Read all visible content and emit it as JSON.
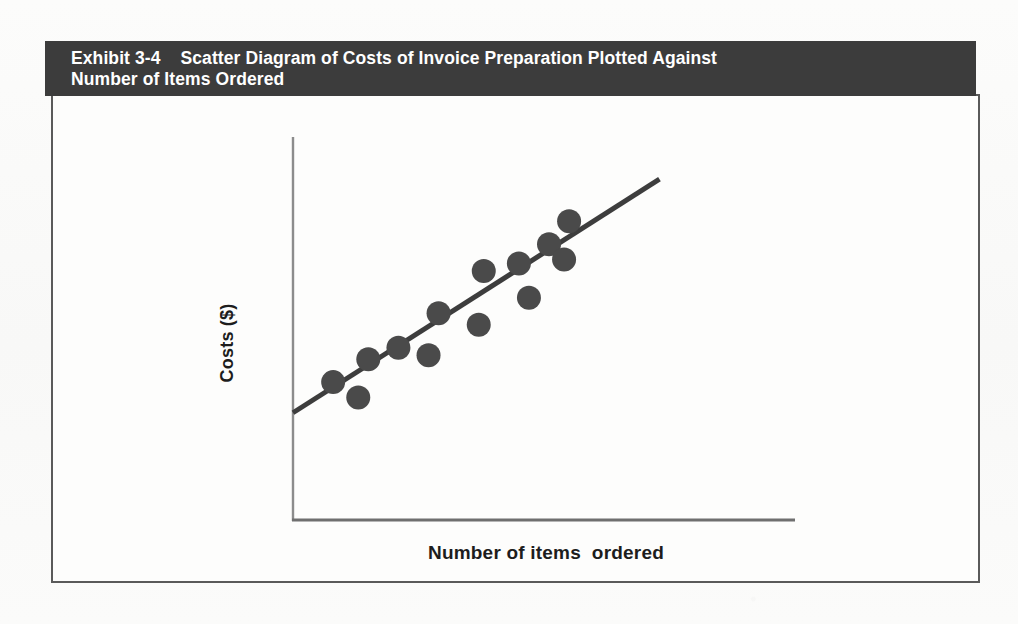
{
  "page": {
    "background_color": "#fbfbfa"
  },
  "exhibit": {
    "header_background": "#3c3c3c",
    "header_text_color": "#ffffff",
    "title_line1": "Exhibit 3-4    Scatter Diagram of Costs of Invoice Preparation Plotted Against",
    "title_line2": "Number of Items Ordered",
    "border_color": "#5a5a5a",
    "body_background": "#fdfdfc"
  },
  "chart_data": {
    "type": "scatter",
    "title": "Exhibit 3-4    Scatter Diagram of Costs of Invoice Preparation Plotted Against Number of Items Ordered",
    "xlabel": "Number of items  ordered",
    "ylabel": "Costs ($)",
    "xlim": [
      0,
      100
    ],
    "ylim": [
      0,
      100
    ],
    "grid": false,
    "legend": null,
    "axis_ticks": {
      "x": [],
      "y": []
    },
    "marker": {
      "shape": "circle",
      "color": "#4a4a4a",
      "radius_px": 12
    },
    "points": [
      {
        "x": 8,
        "y": 36
      },
      {
        "x": 13,
        "y": 32
      },
      {
        "x": 15,
        "y": 42
      },
      {
        "x": 21,
        "y": 45
      },
      {
        "x": 27,
        "y": 43
      },
      {
        "x": 29,
        "y": 54
      },
      {
        "x": 37,
        "y": 51
      },
      {
        "x": 38,
        "y": 65
      },
      {
        "x": 45,
        "y": 67
      },
      {
        "x": 47,
        "y": 58
      },
      {
        "x": 51,
        "y": 72
      },
      {
        "x": 54,
        "y": 68
      },
      {
        "x": 55,
        "y": 78
      }
    ],
    "trendline": {
      "label": "fitted cost line",
      "color": "#3d3d3d",
      "width_px": 5,
      "start": {
        "x": 0,
        "y": 28
      },
      "end": {
        "x": 73,
        "y": 89
      }
    }
  }
}
